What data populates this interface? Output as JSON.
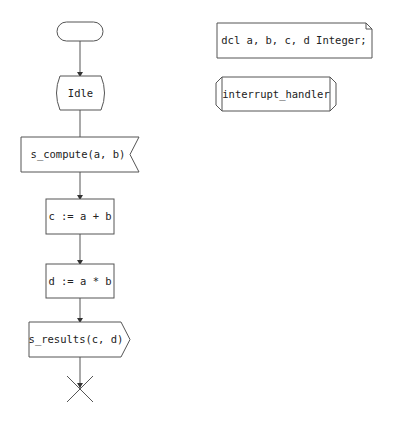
{
  "diagram": {
    "type": "SDL process diagram",
    "colors": {
      "line": "#555555",
      "arrow": "#333333",
      "text": "#222222",
      "background": "#ffffff"
    },
    "nodes": {
      "start": {
        "kind": "start",
        "label": ""
      },
      "idle": {
        "kind": "state",
        "label": "Idle"
      },
      "input": {
        "kind": "input-signal",
        "label": "s_compute(a, b)"
      },
      "task1": {
        "kind": "task",
        "label": "c := a + b"
      },
      "task2": {
        "kind": "task",
        "label": "d := a * b"
      },
      "output": {
        "kind": "output-signal",
        "label": "s_results(c, d)"
      },
      "stop": {
        "kind": "stop",
        "label": ""
      },
      "declaration": {
        "kind": "text-declaration",
        "label": "dcl a, b, c, d Integer;"
      },
      "procedure": {
        "kind": "procedure",
        "label": "interrupt_handler"
      }
    },
    "edges": [
      {
        "from": "start",
        "to": "idle"
      },
      {
        "from": "idle",
        "to": "input"
      },
      {
        "from": "input",
        "to": "task1"
      },
      {
        "from": "task1",
        "to": "task2"
      },
      {
        "from": "task2",
        "to": "output"
      },
      {
        "from": "output",
        "to": "stop"
      }
    ]
  }
}
